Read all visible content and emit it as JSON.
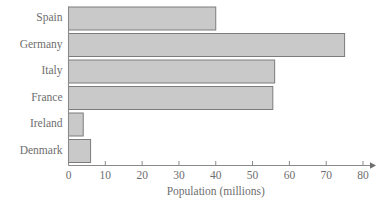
{
  "chart_data": {
    "type": "bar",
    "orientation": "horizontal",
    "title": "",
    "xlabel": "Population (millions)",
    "ylabel": "",
    "categories": [
      "Spain",
      "Germany",
      "Italy",
      "France",
      "Ireland",
      "Denmark"
    ],
    "values": [
      40,
      75,
      56,
      55.5,
      4,
      6
    ],
    "xticks": [
      0,
      10,
      20,
      30,
      40,
      50,
      60,
      70,
      80
    ],
    "xtick_labels": [
      "0",
      "10",
      "20",
      "30",
      "40",
      "50",
      "60",
      "70",
      "80"
    ],
    "xlim": [
      0,
      80
    ],
    "grid": false,
    "legend": false,
    "bar_fill_color": "#c9c9c9",
    "bar_border_color": "#7c7c7c",
    "axis_color": "#8a8a8a",
    "text_color": "#6e6e6e",
    "background_color": "#ffffff"
  }
}
